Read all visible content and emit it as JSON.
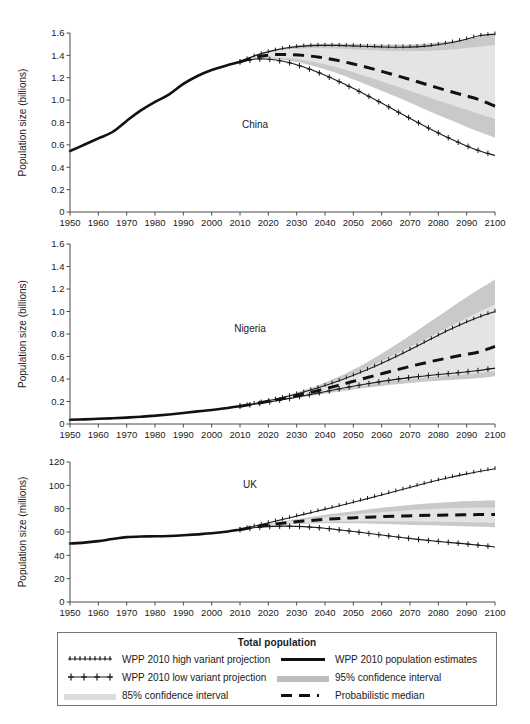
{
  "figure": {
    "shared_xlabel": "",
    "x_ticks": [
      1950,
      1960,
      1970,
      1980,
      1990,
      2000,
      2010,
      2020,
      2030,
      2040,
      2050,
      2060,
      2070,
      2080,
      2090,
      2100
    ],
    "xlim": [
      1950,
      2100
    ],
    "projection_start": 2010
  },
  "legend": {
    "title": "Total population",
    "items": [
      {
        "key": "high-variant",
        "label": "WPP 2010 high variant projection",
        "style": "line-markers-dense",
        "color": "#1a1a1a"
      },
      {
        "key": "estimates",
        "label": "WPP 2010 population estimates",
        "style": "line-thick",
        "color": "#111111"
      },
      {
        "key": "low-variant",
        "label": "WPP 2010 low variant projection",
        "style": "line-markers-plus",
        "color": "#1a1a1a"
      },
      {
        "key": "ci95",
        "label": "95% confidence interval",
        "style": "fill",
        "color": "#bdbdbd"
      },
      {
        "key": "ci85",
        "label": "85% confidence interval",
        "style": "fill",
        "color": "#dcdcdc"
      },
      {
        "key": "median",
        "label": "Probabilistic median",
        "style": "line-dashed",
        "color": "#111111"
      }
    ]
  },
  "chart_data": [
    {
      "type": "line",
      "panel": "china",
      "title": "China",
      "xlabel": "",
      "ylabel": "Population size (billions)",
      "xlim": [
        1950,
        2100
      ],
      "ylim": [
        0,
        1.6
      ],
      "y_ticks": [
        0,
        0.2,
        0.4,
        0.6,
        0.8,
        1.0,
        1.2,
        1.4,
        1.6
      ],
      "y_tick_labels": [
        "0",
        "0.2",
        "0.4",
        "0.6",
        "0.8",
        "1.0",
        "1.2",
        "1.4",
        "1.6"
      ],
      "grid": false,
      "legend_position": "below-figure",
      "x": [
        1950,
        1955,
        1960,
        1965,
        1970,
        1975,
        1980,
        1985,
        1990,
        1995,
        2000,
        2005,
        2010,
        2015,
        2020,
        2025,
        2030,
        2035,
        2040,
        2045,
        2050,
        2055,
        2060,
        2065,
        2070,
        2075,
        2080,
        2085,
        2090,
        2095,
        2100
      ],
      "series": [
        {
          "name": "WPP 2010 population estimates",
          "from": 1950,
          "to": 2010,
          "values": [
            0.545,
            0.601,
            0.658,
            0.715,
            0.814,
            0.908,
            0.984,
            1.052,
            1.145,
            1.216,
            1.269,
            1.308,
            1.341
          ]
        },
        {
          "name": "WPP 2010 high variant projection",
          "from": 2010,
          "to": 2100,
          "values": [
            1.341,
            1.4,
            1.44,
            1.468,
            1.483,
            1.489,
            1.489,
            1.485,
            1.48,
            1.475,
            1.473,
            1.476,
            1.487,
            1.508,
            1.538,
            1.575,
            1.59
          ]
        },
        {
          "name": "WPP 2010 low variant projection",
          "from": 2010,
          "to": 2100,
          "values": [
            1.341,
            1.368,
            1.363,
            1.338,
            1.296,
            1.242,
            1.18,
            1.112,
            1.04,
            0.965,
            0.888,
            0.812,
            0.738,
            0.668,
            0.604,
            0.548,
            0.505
          ]
        },
        {
          "name": "Probabilistic median",
          "from": 2010,
          "to": 2100,
          "values": [
            1.341,
            1.385,
            1.405,
            1.408,
            1.4,
            1.383,
            1.358,
            1.327,
            1.292,
            1.253,
            1.212,
            1.17,
            1.127,
            1.085,
            1.045,
            1.005,
            0.945
          ]
        },
        {
          "name": "95% confidence interval upper",
          "from": 2010,
          "to": 2100,
          "values": [
            1.341,
            1.405,
            1.448,
            1.478,
            1.495,
            1.503,
            1.505,
            1.503,
            1.5,
            1.498,
            1.497,
            1.5,
            1.508,
            1.522,
            1.542,
            1.566,
            1.59
          ]
        },
        {
          "name": "95% confidence interval lower",
          "from": 2010,
          "to": 2100,
          "values": [
            1.341,
            1.368,
            1.37,
            1.355,
            1.328,
            1.29,
            1.244,
            1.192,
            1.136,
            1.078,
            1.018,
            0.956,
            0.894,
            0.833,
            0.774,
            0.718,
            0.665
          ]
        },
        {
          "name": "85% confidence interval upper",
          "from": 2010,
          "to": 2100,
          "values": [
            1.341,
            1.398,
            1.432,
            1.452,
            1.462,
            1.464,
            1.461,
            1.455,
            1.448,
            1.442,
            1.438,
            1.438,
            1.442,
            1.45,
            1.462,
            1.476,
            1.492
          ]
        },
        {
          "name": "85% confidence interval lower",
          "from": 2010,
          "to": 2100,
          "values": [
            1.341,
            1.374,
            1.382,
            1.376,
            1.358,
            1.33,
            1.295,
            1.254,
            1.21,
            1.163,
            1.115,
            1.066,
            1.017,
            0.969,
            0.922,
            0.877,
            0.834
          ]
        }
      ]
    },
    {
      "type": "line",
      "panel": "nigeria",
      "title": "Nigeria",
      "xlabel": "",
      "ylabel": "Population size (billions)",
      "xlim": [
        1950,
        2100
      ],
      "ylim": [
        0,
        1.6
      ],
      "y_ticks": [
        0,
        0.2,
        0.4,
        0.6,
        0.8,
        1.0,
        1.2,
        1.4,
        1.6
      ],
      "y_tick_labels": [
        "0",
        "0.2",
        "0.4",
        "0.6",
        "0.8",
        "1.0",
        "1.2",
        "1.4",
        "1.6"
      ],
      "grid": false,
      "legend_position": "below-figure",
      "x": [
        1950,
        1955,
        1960,
        1965,
        1970,
        1975,
        1980,
        1985,
        1990,
        1995,
        2000,
        2005,
        2010,
        2015,
        2020,
        2025,
        2030,
        2035,
        2040,
        2045,
        2050,
        2055,
        2060,
        2065,
        2070,
        2075,
        2080,
        2085,
        2090,
        2095,
        2100
      ],
      "series": [
        {
          "name": "WPP 2010 population estimates",
          "from": 1950,
          "to": 2010,
          "values": [
            0.038,
            0.041,
            0.046,
            0.051,
            0.057,
            0.064,
            0.074,
            0.085,
            0.098,
            0.112,
            0.125,
            0.14,
            0.158
          ]
        },
        {
          "name": "WPP 2010 high variant projection",
          "from": 2010,
          "to": 2100,
          "values": [
            0.158,
            0.184,
            0.213,
            0.246,
            0.284,
            0.326,
            0.373,
            0.426,
            0.484,
            0.547,
            0.614,
            0.685,
            0.757,
            0.828,
            0.893,
            0.951,
            1.0
          ]
        },
        {
          "name": "WPP 2010 low variant projection",
          "from": 2010,
          "to": 2100,
          "values": [
            0.158,
            0.178,
            0.2,
            0.224,
            0.251,
            0.278,
            0.306,
            0.333,
            0.358,
            0.381,
            0.401,
            0.419,
            0.434,
            0.447,
            0.46,
            0.476,
            0.497
          ]
        },
        {
          "name": "Probabilistic median",
          "from": 2010,
          "to": 2100,
          "values": [
            0.158,
            0.181,
            0.207,
            0.235,
            0.267,
            0.301,
            0.337,
            0.375,
            0.413,
            0.451,
            0.488,
            0.523,
            0.556,
            0.586,
            0.614,
            0.641,
            0.69
          ]
        },
        {
          "name": "95% confidence interval upper",
          "from": 2010,
          "to": 2100,
          "values": [
            0.158,
            0.186,
            0.218,
            0.255,
            0.299,
            0.35,
            0.409,
            0.476,
            0.552,
            0.635,
            0.724,
            0.818,
            0.915,
            1.012,
            1.107,
            1.198,
            1.285
          ]
        },
        {
          "name": "95% confidence interval lower",
          "from": 2010,
          "to": 2100,
          "values": [
            0.158,
            0.177,
            0.197,
            0.218,
            0.24,
            0.262,
            0.284,
            0.305,
            0.324,
            0.341,
            0.356,
            0.368,
            0.379,
            0.388,
            0.397,
            0.408,
            0.425
          ]
        },
        {
          "name": "85% confidence interval upper",
          "from": 2010,
          "to": 2100,
          "values": [
            0.158,
            0.185,
            0.215,
            0.249,
            0.288,
            0.333,
            0.383,
            0.439,
            0.5,
            0.566,
            0.636,
            0.708,
            0.782,
            0.855,
            0.927,
            0.996,
            1.062
          ]
        },
        {
          "name": "85% confidence interval lower",
          "from": 2010,
          "to": 2100,
          "values": [
            0.158,
            0.178,
            0.2,
            0.223,
            0.248,
            0.273,
            0.299,
            0.324,
            0.347,
            0.368,
            0.387,
            0.403,
            0.417,
            0.429,
            0.441,
            0.454,
            0.47
          ]
        }
      ]
    },
    {
      "type": "line",
      "panel": "uk",
      "title": "UK",
      "xlabel": "",
      "ylabel": "Population size (millions)",
      "xlim": [
        1950,
        2100
      ],
      "ylim": [
        0,
        120
      ],
      "y_ticks": [
        0,
        20,
        40,
        60,
        80,
        100,
        120
      ],
      "y_tick_labels": [
        "0",
        "20",
        "40",
        "60",
        "80",
        "100",
        "120"
      ],
      "grid": false,
      "legend_position": "below-figure",
      "x": [
        1950,
        1955,
        1960,
        1965,
        1970,
        1975,
        1980,
        1985,
        1990,
        1995,
        2000,
        2005,
        2010,
        2015,
        2020,
        2025,
        2030,
        2035,
        2040,
        2045,
        2050,
        2055,
        2060,
        2065,
        2070,
        2075,
        2080,
        2085,
        2090,
        2095,
        2100
      ],
      "series": [
        {
          "name": "WPP 2010 population estimates",
          "from": 1950,
          "to": 2010,
          "values": [
            50.1,
            50.9,
            52.2,
            54.0,
            55.6,
            56.2,
            56.3,
            56.6,
            57.2,
            58.0,
            58.9,
            60.2,
            62.0
          ]
        },
        {
          "name": "WPP 2010 high variant projection",
          "from": 2010,
          "to": 2100,
          "values": [
            62.0,
            65.3,
            68.6,
            71.8,
            75.1,
            78.4,
            81.7,
            85.1,
            88.6,
            92.2,
            95.8,
            99.4,
            103.0,
            106.3,
            109.2,
            111.8,
            114.2
          ]
        },
        {
          "name": "WPP 2010 low variant projection",
          "from": 2010,
          "to": 2100,
          "values": [
            62.0,
            63.8,
            64.8,
            65.0,
            64.6,
            63.6,
            62.2,
            60.6,
            58.9,
            57.2,
            55.5,
            53.9,
            52.5,
            51.2,
            50.0,
            48.7,
            47.2
          ]
        },
        {
          "name": "Probabilistic median",
          "from": 2010,
          "to": 2100,
          "values": [
            62.0,
            64.5,
            66.5,
            68.1,
            69.4,
            70.5,
            71.4,
            72.1,
            72.7,
            73.2,
            73.6,
            74.0,
            74.3,
            74.5,
            74.7,
            74.9,
            75.1
          ]
        },
        {
          "name": "95% confidence interval upper",
          "from": 2010,
          "to": 2100,
          "values": [
            62.0,
            65.0,
            67.5,
            69.8,
            71.9,
            73.9,
            75.8,
            77.6,
            79.3,
            80.9,
            82.3,
            83.6,
            84.7,
            85.6,
            86.3,
            86.8,
            87.0
          ]
        },
        {
          "name": "95% confidence interval lower",
          "from": 2010,
          "to": 2100,
          "values": [
            62.0,
            64.0,
            65.4,
            66.4,
            67.0,
            67.4,
            67.5,
            67.4,
            67.2,
            66.9,
            66.5,
            66.1,
            65.7,
            65.3,
            64.9,
            64.5,
            64.1
          ]
        },
        {
          "name": "85% confidence interval upper",
          "from": 2010,
          "to": 2100,
          "values": [
            62.0,
            64.8,
            67.0,
            68.9,
            70.6,
            72.1,
            73.5,
            74.8,
            76.0,
            77.1,
            78.1,
            79.0,
            79.7,
            80.3,
            80.7,
            81.0,
            81.1
          ]
        },
        {
          "name": "85% confidence interval lower",
          "from": 2010,
          "to": 2100,
          "values": [
            62.0,
            64.2,
            65.8,
            67.0,
            67.9,
            68.5,
            68.9,
            69.1,
            69.2,
            69.2,
            69.1,
            68.9,
            68.7,
            68.5,
            68.3,
            68.1,
            67.9
          ]
        }
      ]
    }
  ]
}
